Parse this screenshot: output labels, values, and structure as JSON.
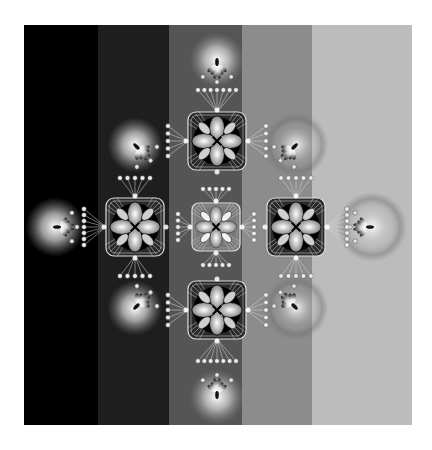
{
  "artwork": {
    "title": "Grayscale kaleidoscopic fractal",
    "frame": {
      "x": 24,
      "y": 25,
      "width": 388,
      "height": 400
    },
    "bands": [
      {
        "x0": 0,
        "x1": 74,
        "color": "#000000"
      },
      {
        "x0": 74,
        "x1": 145,
        "color": "#1e1e1e"
      },
      {
        "x0": 145,
        "x1": 218,
        "color": "#555555"
      },
      {
        "x0": 218,
        "x1": 288,
        "color": "#8c8c8c"
      },
      {
        "x0": 288,
        "x1": 388,
        "color": "#bcbcbc"
      }
    ],
    "medallions": [
      {
        "name": "top",
        "cx": 193,
        "cy": 116,
        "r": 29,
        "style": "dark"
      },
      {
        "name": "left",
        "cx": 111,
        "cy": 202,
        "r": 29,
        "style": "dark"
      },
      {
        "name": "center",
        "cx": 192,
        "cy": 202,
        "r": 24,
        "style": "light"
      },
      {
        "name": "right",
        "cx": 272,
        "cy": 202,
        "r": 29,
        "style": "dark"
      },
      {
        "name": "bottom",
        "cx": 193,
        "cy": 285,
        "r": 29,
        "style": "dark"
      }
    ],
    "orbs": [
      {
        "name": "top",
        "cx": 193,
        "cy": 35,
        "r": 24,
        "halo": false,
        "dir": 270
      },
      {
        "name": "left",
        "cx": 31,
        "cy": 202,
        "r": 26,
        "halo": false,
        "dir": 180
      },
      {
        "name": "right",
        "cx": 348,
        "cy": 202,
        "r": 26,
        "halo": true,
        "dir": 0
      },
      {
        "name": "bottom",
        "cx": 193,
        "cy": 372,
        "r": 24,
        "halo": false,
        "dir": 90
      },
      {
        "name": "upper-left",
        "cx": 111,
        "cy": 120,
        "r": 24,
        "halo": false,
        "dir": 225
      },
      {
        "name": "upper-right",
        "cx": 272,
        "cy": 120,
        "r": 24,
        "halo": true,
        "dir": 315
      },
      {
        "name": "lower-left",
        "cx": 111,
        "cy": 283,
        "r": 24,
        "halo": false,
        "dir": 135
      },
      {
        "name": "lower-right",
        "cx": 272,
        "cy": 283,
        "r": 24,
        "halo": true,
        "dir": 45
      }
    ],
    "colors": {
      "orb_core": "#ffffff",
      "medallion_dark": "#000000",
      "medallion_light": "#e8e8e8",
      "halo": "#7a7a7a"
    }
  }
}
